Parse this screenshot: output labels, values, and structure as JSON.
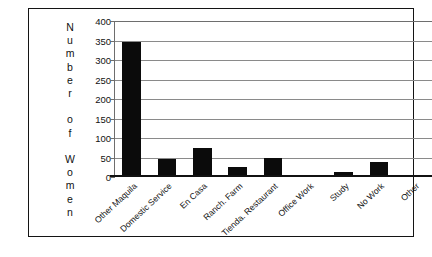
{
  "chart_data": {
    "type": "bar",
    "title": "",
    "xlabel": "",
    "ylabel": "Number of Women",
    "ylabel_letters": [
      "N",
      "u",
      "m",
      "b",
      "e",
      "r",
      "",
      "o",
      "f",
      "",
      "W",
      "o",
      "m",
      "e",
      "n"
    ],
    "categories": [
      "Other Maquila",
      "Domestic Service",
      "En Casa",
      "Ranch. Farm",
      "Tienda. Restaurant",
      "Office Work",
      "Study",
      "No Work",
      "Other"
    ],
    "values": [
      347,
      45,
      75,
      25,
      48,
      3,
      12,
      38,
      6
    ],
    "ylim": [
      0,
      400
    ],
    "ytick_labels": [
      "400",
      "350",
      "300",
      "250",
      "200",
      "150",
      "100",
      "50",
      "0"
    ],
    "ytick_values": [
      400,
      350,
      300,
      250,
      200,
      150,
      100,
      50,
      0
    ],
    "grid": true,
    "legend": "none",
    "bar_color": "#0b0b0b",
    "grid_color": "#8a8a8a",
    "frame_color": "#141414"
  }
}
